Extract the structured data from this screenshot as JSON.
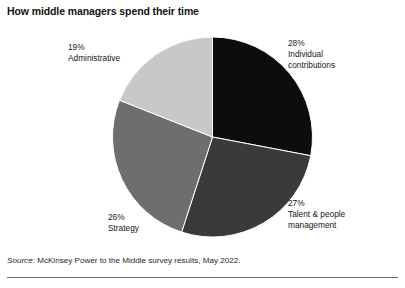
{
  "chart_data": {
    "type": "pie",
    "title": "How middle managers spend their time",
    "xlabel": "",
    "ylabel": "",
    "legend_position": "none",
    "grid": false,
    "start_angle_deg": 0,
    "direction": "clockwise",
    "units": "percent",
    "total": 100,
    "categories": [
      "Individual contributions",
      "Talent & people management",
      "Strategy",
      "Administrative"
    ],
    "values": [
      28,
      27,
      26,
      19
    ],
    "colors": [
      "#0d0d0d",
      "#3a3a3a",
      "#6e6e6e",
      "#c8c8c8"
    ],
    "slices": [
      {
        "label": "Individual contributions",
        "value": 28,
        "percent_text": "28%",
        "color": "#0d0d0d",
        "start_deg": 0,
        "end_deg": 100.8
      },
      {
        "label": "Talent & people management",
        "value": 27,
        "percent_text": "27%",
        "color": "#3a3a3a",
        "start_deg": 100.8,
        "end_deg": 198.0
      },
      {
        "label": "Strategy",
        "value": 26,
        "percent_text": "26%",
        "color": "#6e6e6e",
        "start_deg": 198.0,
        "end_deg": 291.6
      },
      {
        "label": "Administrative",
        "value": 19,
        "percent_text": "19%",
        "color": "#c8c8c8",
        "start_deg": 291.6,
        "end_deg": 360.0
      }
    ],
    "source": "Source: McKinsey Power to the Middle survey results, May 2022."
  },
  "labels": {
    "individual": {
      "percent": "28%",
      "name_line1": "Individual",
      "name_line2": "contributions"
    },
    "talent": {
      "percent": "27%",
      "name_line1": "Talent & people",
      "name_line2": "management"
    },
    "strategy": {
      "percent": "26%",
      "name_line1": "Strategy",
      "name_line2": ""
    },
    "administrative": {
      "percent": "19%",
      "name_line1": "Administrative",
      "name_line2": ""
    }
  },
  "source": {
    "prefix": "Source:",
    "text": "McKinsey Power to the Middle survey results, May 2022."
  }
}
